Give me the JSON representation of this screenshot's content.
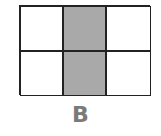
{
  "figure": {
    "label": "B",
    "grid": {
      "rows": 2,
      "columns": 3,
      "shaded_cells": [
        [
          0,
          1
        ],
        [
          1,
          1
        ]
      ],
      "shade_color": "#a9a9a9",
      "line_color": "#222222"
    }
  }
}
